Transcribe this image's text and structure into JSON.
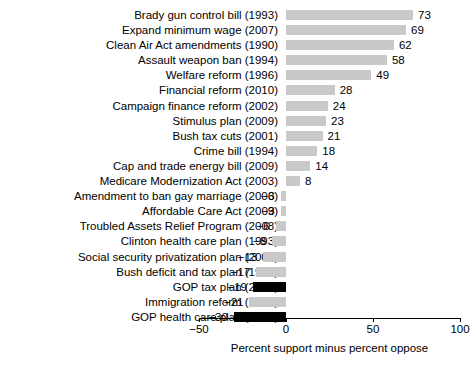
{
  "chart_data": {
    "type": "bar",
    "orientation": "horizontal",
    "title": "",
    "xlabel": "Percent support minus percent oppose",
    "ylabel": "",
    "xlim": [
      -50,
      100
    ],
    "xticks": [
      -50,
      0,
      50,
      100
    ],
    "xtick_labels": [
      "−50",
      "0",
      "50",
      "100"
    ],
    "grid": false,
    "legend": "none",
    "categories": [
      "Brady gun control bill (1993)",
      "Expand minimum wage (2007)",
      "Clean Air Act amendments (1990)",
      "Assault weapon ban (1994)",
      "Welfare reform (1996)",
      "Financial reform (2010)",
      "Campaign finance reform (2002)",
      "Stimulus plan (2009)",
      "Bush tax cuts (2001)",
      "Crime bill (1994)",
      "Cap and trade energy bill (2009)",
      "Medicare Modernization Act (2003)",
      "Amendment to ban gay marriage (2006)",
      "Affordable Care Act (2009)",
      "Troubled Assets Relief Program (2008)",
      "Clinton health care plan (1993)",
      "Social security privatization plan (2005)",
      "Bush deficit and tax plan (1990)",
      "GOP tax plan (2017)",
      "Immigration reform (2007)",
      "GOP health care plan (2017)"
    ],
    "values": [
      73,
      69,
      62,
      58,
      49,
      28,
      24,
      23,
      21,
      18,
      14,
      8,
      -3,
      -3,
      -6,
      -8,
      -13,
      -17,
      -19,
      -21,
      -30
    ],
    "value_labels": [
      "73",
      "69",
      "62",
      "58",
      "49",
      "28",
      "24",
      "23",
      "21",
      "18",
      "14",
      "8",
      "−3",
      "−3",
      "−6",
      "−8",
      "−13",
      "−17",
      "−19",
      "−21",
      "−30"
    ],
    "bar_colors": [
      "#c9c9c9",
      "#c9c9c9",
      "#c9c9c9",
      "#c9c9c9",
      "#c9c9c9",
      "#c9c9c9",
      "#c9c9c9",
      "#c9c9c9",
      "#c9c9c9",
      "#c9c9c9",
      "#c9c9c9",
      "#c9c9c9",
      "#c9c9c9",
      "#c9c9c9",
      "#c9c9c9",
      "#c9c9c9",
      "#c9c9c9",
      "#c9c9c9",
      "#000000",
      "#c9c9c9",
      "#000000"
    ],
    "colors": {
      "bar_gray": "#c9c9c9",
      "bar_black": "#000000",
      "axis": "#000000",
      "background": "#ffffff"
    }
  }
}
